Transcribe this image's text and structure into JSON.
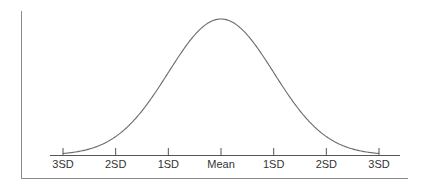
{
  "figure": {
    "type": "normal-distribution-curve",
    "title": "",
    "x_axis_labels": [
      "3SD",
      "2SD",
      "1SD",
      "Mean",
      "1SD",
      "2SD",
      "3SD"
    ],
    "colors": {
      "curve": "#6b6b6b",
      "axis": "#555555",
      "frame": "#8a8a8a",
      "text": "#333333"
    }
  },
  "chart_data": {
    "type": "line",
    "title": "",
    "xlabel": "",
    "ylabel": "",
    "categories": [
      "3SD",
      "2SD",
      "1SD",
      "Mean",
      "1SD",
      "2SD",
      "3SD"
    ],
    "x": [
      -3,
      -2,
      -1,
      0,
      1,
      2,
      3
    ],
    "series": [
      {
        "name": "Normal distribution",
        "values": [
          0.004,
          0.054,
          0.242,
          0.399,
          0.242,
          0.054,
          0.004
        ]
      }
    ],
    "grid": false,
    "legend": "none"
  }
}
